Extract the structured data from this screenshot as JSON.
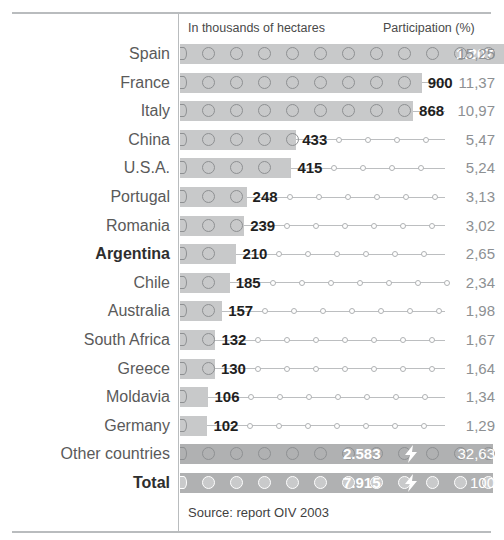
{
  "header": {
    "units_label": "In thousands of hectares",
    "participation_label": "Participation (%)"
  },
  "source": "Source: report OIV 2003",
  "colors": {
    "bar": "#c8c9ca",
    "bar_summary": "#b0b1b2",
    "rule": "#b9bcbe",
    "label": "#5a5a5a",
    "value": "#1f1f1f",
    "percent": "#8d9093",
    "value_on_bar": "#ffffff"
  },
  "icons": {
    "bolt": "lightning-bolt-icon"
  },
  "chart_data": {
    "type": "bar",
    "title": "",
    "xlabel": "In thousands of hectares",
    "ylabel": "",
    "grid": false,
    "legend": "none",
    "orientation": "horizontal",
    "xlim": [
      0,
      7915
    ],
    "value_unit": "thousands of hectares",
    "decimal_separator": ",",
    "thousands_separator": ".",
    "categories": [
      "Spain",
      "France",
      "Italy",
      "China",
      "U.S.A.",
      "Portugal",
      "Romania",
      "Argentina",
      "Chile",
      "Australia",
      "South Africa",
      "Greece",
      "Moldavia",
      "Germany",
      "Other countries",
      "Total"
    ],
    "values": [
      1207,
      900,
      868,
      433,
      415,
      248,
      239,
      210,
      185,
      157,
      132,
      130,
      106,
      102,
      2583,
      7915
    ],
    "participation_percent": [
      15.25,
      11.37,
      10.97,
      5.47,
      5.24,
      3.13,
      3.02,
      2.65,
      2.34,
      1.98,
      1.67,
      1.64,
      1.34,
      1.29,
      32.63,
      100
    ],
    "rows": [
      {
        "label": "Spain",
        "value_text": "1.207",
        "value": 1207,
        "pct_text": "15,25",
        "pct": 15.25,
        "bold": false,
        "summary": false,
        "value_inside": true
      },
      {
        "label": "France",
        "value_text": "900",
        "value": 900,
        "pct_text": "11,37",
        "pct": 11.37,
        "bold": false,
        "summary": false,
        "value_inside": false
      },
      {
        "label": "Italy",
        "value_text": "868",
        "value": 868,
        "pct_text": "10,97",
        "pct": 10.97,
        "bold": false,
        "summary": false,
        "value_inside": false
      },
      {
        "label": "China",
        "value_text": "433",
        "value": 433,
        "pct_text": "5,47",
        "pct": 5.47,
        "bold": false,
        "summary": false,
        "value_inside": false
      },
      {
        "label": "U.S.A.",
        "value_text": "415",
        "value": 415,
        "pct_text": "5,24",
        "pct": 5.24,
        "bold": false,
        "summary": false,
        "value_inside": false
      },
      {
        "label": "Portugal",
        "value_text": "248",
        "value": 248,
        "pct_text": "3,13",
        "pct": 3.13,
        "bold": false,
        "summary": false,
        "value_inside": false
      },
      {
        "label": "Romania",
        "value_text": "239",
        "value": 239,
        "pct_text": "3,02",
        "pct": 3.02,
        "bold": false,
        "summary": false,
        "value_inside": false
      },
      {
        "label": "Argentina",
        "value_text": "210",
        "value": 210,
        "pct_text": "2,65",
        "pct": 2.65,
        "bold": true,
        "summary": false,
        "value_inside": false
      },
      {
        "label": "Chile",
        "value_text": "185",
        "value": 185,
        "pct_text": "2,34",
        "pct": 2.34,
        "bold": false,
        "summary": false,
        "value_inside": false
      },
      {
        "label": "Australia",
        "value_text": "157",
        "value": 157,
        "pct_text": "1,98",
        "pct": 1.98,
        "bold": false,
        "summary": false,
        "value_inside": false
      },
      {
        "label": "South Africa",
        "value_text": "132",
        "value": 132,
        "pct_text": "1,67",
        "pct": 1.67,
        "bold": false,
        "summary": false,
        "value_inside": false
      },
      {
        "label": "Greece",
        "value_text": "130",
        "value": 130,
        "pct_text": "1,64",
        "pct": 1.64,
        "bold": false,
        "summary": false,
        "value_inside": false
      },
      {
        "label": "Moldavia",
        "value_text": "106",
        "value": 106,
        "pct_text": "1,34",
        "pct": 1.34,
        "bold": false,
        "summary": false,
        "value_inside": false
      },
      {
        "label": "Germany",
        "value_text": "102",
        "value": 102,
        "pct_text": "1,29",
        "pct": 1.29,
        "bold": false,
        "summary": false,
        "value_inside": false
      },
      {
        "label": "Other countries",
        "value_text": "2.583",
        "value": 2583,
        "pct_text": "32,63",
        "pct": 32.63,
        "bold": false,
        "summary": true,
        "value_inside": true
      },
      {
        "label": "Total",
        "value_text": "7.915",
        "value": 7915,
        "pct_text": "100",
        "pct": 100,
        "bold": true,
        "summary": true,
        "value_inside": true
      }
    ]
  }
}
